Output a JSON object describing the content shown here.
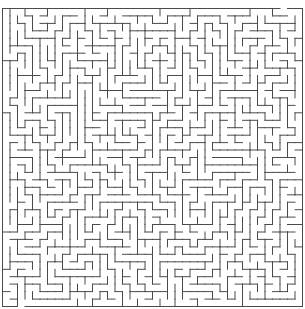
{
  "maze": {
    "cols": 40,
    "rows": 40,
    "origin_x": 2.5,
    "origin_y": 8.5,
    "cell_w": 7.5,
    "cell_h": 7.45,
    "wall_color": "#4a4a4a",
    "background_color": "#ffffff",
    "stroke_width": 1,
    "seed": 20240517
  }
}
